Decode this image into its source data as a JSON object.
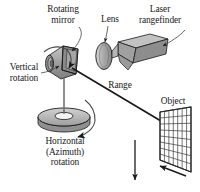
{
  "figure": {
    "background_color": "#ffffff",
    "ink_color": "#1a1a1a",
    "width": 200,
    "height": 192
  },
  "labels": {
    "rotating_mirror": {
      "line1": "Rotating",
      "line2": "mirror"
    },
    "lens": "Lens",
    "laser_rangefinder": {
      "line1": "Laser",
      "line2": "rangefinder"
    },
    "vertical_rotation": {
      "line1": "Vertical",
      "line2": "rotation"
    },
    "range": "Range",
    "object": "Object",
    "horizontal_rotation": {
      "line1": "Horizontal",
      "line2": "(Azimuth)",
      "line3": "rotation"
    }
  },
  "components": {
    "mirror_drum": {
      "name": "rotating-mirror-drum",
      "fill": "#9a9a9a",
      "stroke": "#1a1a1a"
    },
    "lens": {
      "name": "lens",
      "fill": "#b0b0b0",
      "stroke": "#1a1a1a"
    },
    "rangefinder": {
      "name": "laser-rangefinder-body",
      "fill": "#a8a8a8",
      "stroke": "#1a1a1a"
    },
    "turntable": {
      "name": "azimuth-turntable",
      "fill": "#bcbcbc",
      "stroke": "#1a1a1a"
    },
    "object_grid": {
      "name": "object-grid",
      "fill": "#ffffff",
      "stroke": "#3a3a3a",
      "rows": 8,
      "cols": 7
    }
  },
  "annotations": {
    "range_beam": "range-measurement-beam",
    "vertical_rotation_arc": "vertical-rotation-arrow",
    "horizontal_rotation_arc": "horizontal-rotation-arrow",
    "scan_down_arrow": "vertical-scan-direction-arrow",
    "object_width_arrow": "object-extent-arrow"
  }
}
